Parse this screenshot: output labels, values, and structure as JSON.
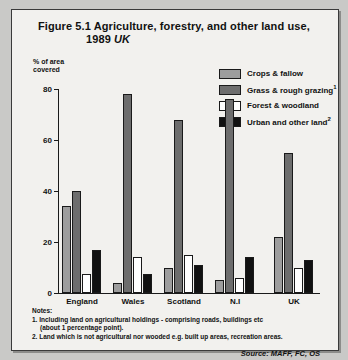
{
  "figure": {
    "title_line1": "Figure 5.1  Agriculture, forestry, and other land use,",
    "title_line2_year": "1989",
    "title_line2_region": "UK"
  },
  "axis": {
    "y_label": "% of area\ncovered",
    "y_ticks": [
      "80",
      "60",
      "40",
      "20",
      "0"
    ]
  },
  "legend": {
    "items": [
      {
        "label": "Crops & fallow",
        "sup": "",
        "color": "#9d9d9d"
      },
      {
        "label": "Grass & rough grazing",
        "sup": "1",
        "color": "#6d6d6d"
      },
      {
        "label": "Forest & woodland",
        "sup": "",
        "color": "#ffffff"
      },
      {
        "label": "Urban and other land",
        "sup": "2",
        "color": "#111111"
      }
    ]
  },
  "notes": {
    "heading": "Notes:",
    "note1_line1": "1.  Including land on agricultural holdings - comprising roads, buildings etc",
    "note1_line2": "(about 1 percentage point).",
    "note2": "2.  Land which is not agricultural nor wooded e.g. built up areas, recreation areas."
  },
  "source": "Source:  MAFF, FC, OS",
  "chart_data": {
    "type": "bar",
    "title": "Figure 5.1 Agriculture, forestry, and other land use, 1989 UK",
    "xlabel": "",
    "ylabel": "% of area covered",
    "ylim": [
      0,
      80
    ],
    "yticks": [
      0,
      20,
      40,
      60,
      80
    ],
    "grid": false,
    "legend_position": "top-right",
    "categories": [
      "England",
      "Wales",
      "Scotland",
      "N.I",
      "UK"
    ],
    "series": [
      {
        "name": "Crops & fallow",
        "color": "#9d9d9d",
        "values": [
          34,
          4,
          10,
          5,
          22
        ]
      },
      {
        "name": "Grass & rough grazing",
        "color": "#6d6d6d",
        "values": [
          40,
          78,
          68,
          76,
          55
        ]
      },
      {
        "name": "Forest & woodland",
        "color": "#ffffff",
        "values": [
          7.5,
          14,
          15,
          6,
          10
        ]
      },
      {
        "name": "Urban and other land",
        "color": "#111111",
        "values": [
          17,
          7.5,
          11,
          14,
          13
        ]
      }
    ]
  }
}
